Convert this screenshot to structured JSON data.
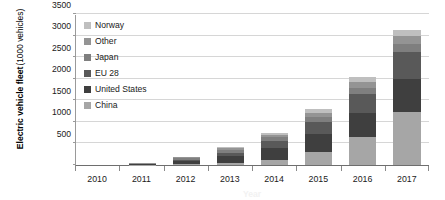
{
  "chart_data": {
    "type": "bar",
    "stacked": true,
    "title": "",
    "xlabel": "",
    "ylabel": "Electric vehicle fleet (1000 vehicles)",
    "ylabel_main": "Electric vehicle fleet",
    "ylabel_sub": "(1000 vehicles)",
    "categories": [
      "2010",
      "2011",
      "2012",
      "2013",
      "2014",
      "2015",
      "2016",
      "2017"
    ],
    "ylim": [
      0,
      3500
    ],
    "yticks": [
      0,
      500,
      1000,
      1500,
      2000,
      2500,
      3000,
      3500
    ],
    "ytick_labels": [
      "",
      "500",
      "1000",
      "1500",
      "2000",
      "2500",
      "3000",
      "3500"
    ],
    "grid": "horizontal",
    "legend_position": "top-left-inside",
    "series": [
      {
        "name": "China",
        "color": "#a6a6a6",
        "values": [
          0,
          6,
          16,
          40,
          110,
          310,
          650,
          1230
        ]
      },
      {
        "name": "United States",
        "color": "#3f3f3f",
        "values": [
          1,
          10,
          75,
          175,
          290,
          400,
          560,
          760
        ]
      },
      {
        "name": "EU 28",
        "color": "#595959",
        "values": [
          1,
          6,
          35,
          70,
          150,
          290,
          430,
          620
        ]
      },
      {
        "name": "Japan",
        "color": "#7f7f7f",
        "values": [
          1,
          13,
          40,
          70,
          105,
          125,
          150,
          205
        ]
      },
      {
        "name": "Other",
        "color": "#949494",
        "values": [
          0,
          5,
          20,
          30,
          50,
          90,
          140,
          180
        ]
      },
      {
        "name": "Norway",
        "color": "#bfbfbf",
        "values": [
          0,
          4,
          10,
          25,
          45,
          75,
          110,
          140
        ]
      }
    ],
    "totals": [
      3,
      44,
      196,
      410,
      750,
      1290,
      2040,
      3135
    ],
    "legend_entries": [
      "Norway",
      "Other",
      "Japan",
      "EU 28",
      "United States",
      "China"
    ]
  },
  "axis": {
    "y_title_main": "Electric vehicle fleet",
    "y_title_sub": "(1000 vehicles)"
  },
  "xaxis_title_cropped": "Year"
}
